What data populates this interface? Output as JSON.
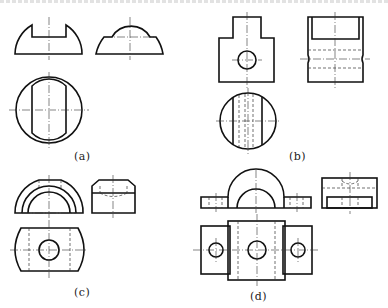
{
  "figure": {
    "top_cutoff_text": "",
    "colors": {
      "line": "#111111",
      "background": "#ffffff"
    },
    "panels": [
      {
        "id": "a",
        "label": "(a)",
        "views": [
          "front view: half-round with rectangular slot",
          "side view: dome on plate",
          "top view: circle with flat-ended slot"
        ]
      },
      {
        "id": "b",
        "label": "(b)",
        "views": [
          "front view: stepped block with hole",
          "side view: block with top slot and hidden bore",
          "top view: circle with vertical lines"
        ]
      },
      {
        "id": "c",
        "label": "(c)",
        "views": [
          "front view: concentric arches",
          "side view: block with chamfered top",
          "top view: barrel-shaped plate with hole"
        ]
      },
      {
        "id": "d",
        "label": "(d)",
        "views": [
          "front view: arch on base plate",
          "side view: block with recess",
          "top view: plate with three holes"
        ]
      }
    ]
  }
}
